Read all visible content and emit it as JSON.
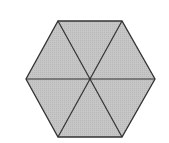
{
  "diagram": {
    "shape": "regular-hexagon",
    "subdivision": "6 triangles meeting at center",
    "fill_color": "#c6c6c6",
    "stroke_color": "#333333",
    "background": "#ffffff",
    "vertices": [
      [
        58,
        21
      ],
      [
        122,
        21
      ],
      [
        155,
        79
      ],
      [
        122,
        137
      ],
      [
        58,
        137
      ],
      [
        26,
        79
      ]
    ],
    "center": [
      91,
      79
    ]
  }
}
